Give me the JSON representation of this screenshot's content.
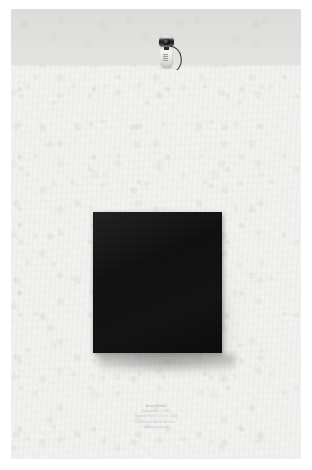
{
  "artwork": {
    "medium_note": "photograph of framed black monochrome panel on textured paper",
    "background_color": "#f2f2f0",
    "wall_band_color": "#dfdfdd",
    "panel_color": "#0f0f0f"
  },
  "scene": {
    "camera": {
      "label": "webcam",
      "icon": "webcam-icon",
      "body_color": "#eaeae8",
      "lens_color": "#121212",
      "cable_color": "#3a3a3a"
    },
    "panel": {
      "label": "black square panel",
      "color": "#0f0f0f"
    }
  },
  "caption": {
    "lines": [
      "Anna Chinich",
      "Evaporation I, 2019",
      "Organdy Panel 14.50 in. 2019",
      "Collection: Artist's Archive",
      "Gallery: privacies"
    ]
  }
}
